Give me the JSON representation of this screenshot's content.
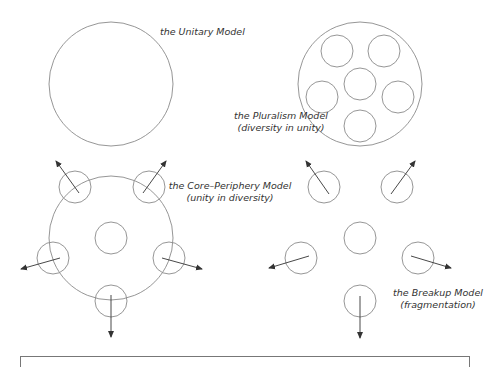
{
  "colors": {
    "circle": "#8a8a8a",
    "arrow": "#333333",
    "text": "#333333",
    "box": "#777777"
  },
  "models": {
    "unitary": {
      "title": "the Unitary Model"
    },
    "pluralism": {
      "title": "the Pluralism Model",
      "subtitle": "(diversity in unity)"
    },
    "core_periphery": {
      "title": "the Core–Periphery Model",
      "subtitle": "(unity in diversity)"
    },
    "breakup": {
      "title": "the Breakup Model",
      "subtitle": "(fragmentation)"
    }
  }
}
